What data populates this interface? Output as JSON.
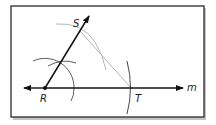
{
  "figure": {
    "type": "geometric-construction",
    "colors": {
      "frame": "#2a2a2a",
      "shadow": "#bdbdbd",
      "line": "#111111",
      "construction": "#333333",
      "gray_arc": "#b5b5b5"
    },
    "points": [
      {
        "name": "R",
        "label": "R",
        "x": 45,
        "y": 88
      },
      {
        "name": "S",
        "label": "S",
        "x": 80,
        "y": 31
      },
      {
        "name": "T",
        "label": "T",
        "x": 131,
        "y": 88
      }
    ],
    "line_label": "m",
    "labels": {
      "R": "R",
      "S": "S",
      "T": "T",
      "m": "m"
    }
  }
}
